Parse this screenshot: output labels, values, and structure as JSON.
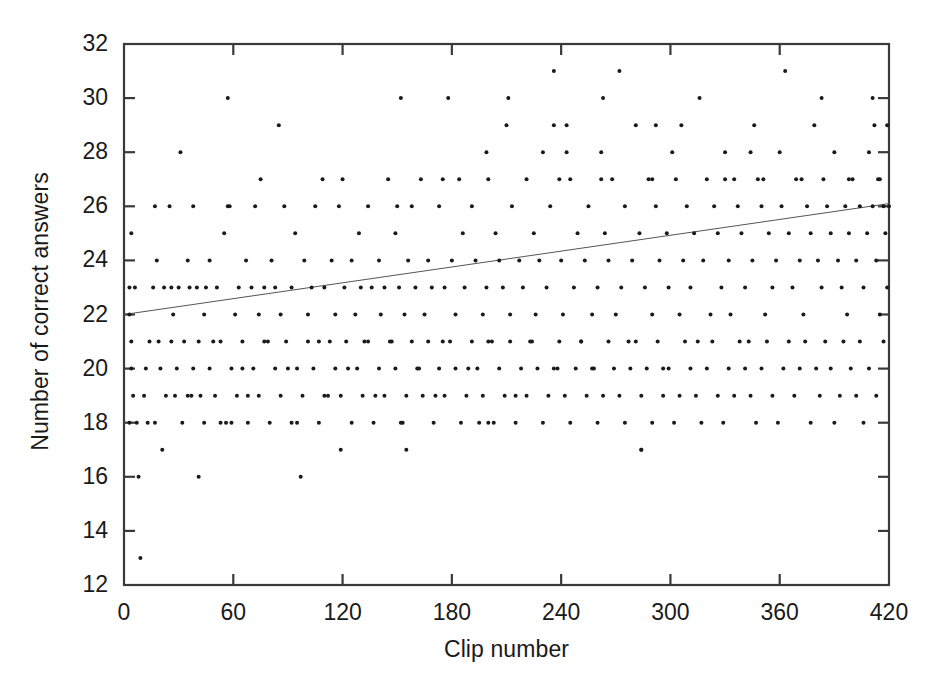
{
  "chart_data": {
    "type": "scatter",
    "title": "",
    "xlabel": "Clip number",
    "ylabel": "Number of correct answers",
    "xlim": [
      0,
      420
    ],
    "ylim": [
      12,
      32
    ],
    "xticks": [
      0,
      60,
      120,
      180,
      240,
      300,
      360,
      420
    ],
    "yticks": [
      12,
      14,
      16,
      18,
      20,
      22,
      24,
      26,
      28,
      30,
      32
    ],
    "grid": false,
    "legend": null,
    "marker": {
      "shape": "circle",
      "size_px": 4,
      "color": "#1a1a1a"
    },
    "trendline": {
      "label": "linear fit",
      "x": [
        0,
        420
      ],
      "y": [
        22.0,
        26.1
      ],
      "color": "#555555",
      "width_px": 1
    },
    "points": [
      [
        3,
        23
      ],
      [
        3,
        22
      ],
      [
        3,
        18
      ],
      [
        4,
        25
      ],
      [
        4,
        21
      ],
      [
        4,
        20
      ],
      [
        5,
        19
      ],
      [
        6,
        23
      ],
      [
        7,
        18
      ],
      [
        8,
        16
      ],
      [
        9,
        13
      ],
      [
        12,
        20
      ],
      [
        13,
        18
      ],
      [
        16,
        23
      ],
      [
        17,
        26
      ],
      [
        18,
        24
      ],
      [
        19,
        21
      ],
      [
        21,
        17
      ],
      [
        22,
        23
      ],
      [
        25,
        26
      ],
      [
        26,
        23
      ],
      [
        27,
        22
      ],
      [
        28,
        19
      ],
      [
        30,
        23
      ],
      [
        31,
        28
      ],
      [
        33,
        21
      ],
      [
        35,
        24
      ],
      [
        36,
        23
      ],
      [
        37,
        19
      ],
      [
        38,
        26
      ],
      [
        40,
        23
      ],
      [
        41,
        16
      ],
      [
        42,
        19
      ],
      [
        44,
        22
      ],
      [
        45,
        23
      ],
      [
        47,
        24
      ],
      [
        49,
        21
      ],
      [
        51,
        23
      ],
      [
        53,
        18
      ],
      [
        55,
        25
      ],
      [
        57,
        30
      ],
      [
        58,
        26
      ],
      [
        59,
        18
      ],
      [
        61,
        22
      ],
      [
        63,
        23
      ],
      [
        65,
        20
      ],
      [
        67,
        24
      ],
      [
        68,
        19
      ],
      [
        70,
        23
      ],
      [
        72,
        26
      ],
      [
        74,
        22
      ],
      [
        75,
        27
      ],
      [
        77,
        23
      ],
      [
        79,
        21
      ],
      [
        81,
        24
      ],
      [
        83,
        23
      ],
      [
        85,
        29
      ],
      [
        86,
        22
      ],
      [
        88,
        26
      ],
      [
        90,
        20
      ],
      [
        92,
        23
      ],
      [
        94,
        25
      ],
      [
        95,
        18
      ],
      [
        97,
        16
      ],
      [
        99,
        24
      ],
      [
        101,
        22
      ],
      [
        103,
        23
      ],
      [
        105,
        26
      ],
      [
        107,
        21
      ],
      [
        109,
        27
      ],
      [
        110,
        23
      ],
      [
        112,
        19
      ],
      [
        114,
        24
      ],
      [
        116,
        22
      ],
      [
        118,
        26
      ],
      [
        119,
        17
      ],
      [
        121,
        23
      ],
      [
        123,
        20
      ],
      [
        125,
        24
      ],
      [
        127,
        22
      ],
      [
        129,
        25
      ],
      [
        130,
        23
      ],
      [
        132,
        21
      ],
      [
        134,
        26
      ],
      [
        136,
        23
      ],
      [
        138,
        19
      ],
      [
        140,
        24
      ],
      [
        141,
        22
      ],
      [
        143,
        23
      ],
      [
        145,
        27
      ],
      [
        147,
        21
      ],
      [
        149,
        25
      ],
      [
        151,
        23
      ],
      [
        153,
        18
      ],
      [
        154,
        22
      ],
      [
        156,
        24
      ],
      [
        158,
        26
      ],
      [
        160,
        23
      ],
      [
        162,
        20
      ],
      [
        163,
        27
      ],
      [
        165,
        22
      ],
      [
        167,
        24
      ],
      [
        169,
        23
      ],
      [
        171,
        19
      ],
      [
        173,
        26
      ],
      [
        175,
        21
      ],
      [
        176,
        23
      ],
      [
        178,
        30
      ],
      [
        180,
        24
      ],
      [
        182,
        22
      ],
      [
        184,
        27
      ],
      [
        186,
        25
      ],
      [
        187,
        23
      ],
      [
        189,
        20
      ],
      [
        191,
        26
      ],
      [
        193,
        24
      ],
      [
        195,
        18
      ],
      [
        197,
        22
      ],
      [
        199,
        23
      ],
      [
        200,
        27
      ],
      [
        202,
        21
      ],
      [
        204,
        25
      ],
      [
        206,
        24
      ],
      [
        208,
        23
      ],
      [
        210,
        29
      ],
      [
        212,
        22
      ],
      [
        213,
        26
      ],
      [
        215,
        19
      ],
      [
        217,
        24
      ],
      [
        219,
        23
      ],
      [
        221,
        27
      ],
      [
        223,
        21
      ],
      [
        225,
        25
      ],
      [
        226,
        22
      ],
      [
        228,
        24
      ],
      [
        230,
        28
      ],
      [
        232,
        23
      ],
      [
        234,
        26
      ],
      [
        236,
        31
      ],
      [
        238,
        20
      ],
      [
        240,
        24
      ],
      [
        241,
        22
      ],
      [
        243,
        29
      ],
      [
        245,
        27
      ],
      [
        247,
        23
      ],
      [
        249,
        25
      ],
      [
        251,
        21
      ],
      [
        253,
        24
      ],
      [
        255,
        26
      ],
      [
        257,
        22
      ],
      [
        258,
        20
      ],
      [
        260,
        23
      ],
      [
        262,
        28
      ],
      [
        264,
        25
      ],
      [
        266,
        24
      ],
      [
        268,
        27
      ],
      [
        270,
        22
      ],
      [
        272,
        31
      ],
      [
        273,
        23
      ],
      [
        275,
        26
      ],
      [
        277,
        21
      ],
      [
        279,
        24
      ],
      [
        281,
        29
      ],
      [
        283,
        25
      ],
      [
        284,
        17
      ],
      [
        286,
        23
      ],
      [
        288,
        27
      ],
      [
        290,
        22
      ],
      [
        292,
        26
      ],
      [
        294,
        24
      ],
      [
        296,
        20
      ],
      [
        298,
        25
      ],
      [
        299,
        23
      ],
      [
        301,
        28
      ],
      [
        303,
        27
      ],
      [
        305,
        22
      ],
      [
        307,
        24
      ],
      [
        309,
        26
      ],
      [
        311,
        23
      ],
      [
        313,
        25
      ],
      [
        315,
        21
      ],
      [
        316,
        30
      ],
      [
        318,
        24
      ],
      [
        320,
        27
      ],
      [
        322,
        22
      ],
      [
        324,
        26
      ],
      [
        326,
        25
      ],
      [
        328,
        23
      ],
      [
        330,
        28
      ],
      [
        332,
        24
      ],
      [
        333,
        22
      ],
      [
        335,
        27
      ],
      [
        337,
        26
      ],
      [
        339,
        25
      ],
      [
        341,
        23
      ],
      [
        343,
        21
      ],
      [
        345,
        24
      ],
      [
        346,
        29
      ],
      [
        348,
        27
      ],
      [
        350,
        26
      ],
      [
        352,
        22
      ],
      [
        354,
        25
      ],
      [
        356,
        23
      ],
      [
        358,
        24
      ],
      [
        360,
        28
      ],
      [
        361,
        26
      ],
      [
        363,
        31
      ],
      [
        365,
        25
      ],
      [
        367,
        23
      ],
      [
        369,
        27
      ],
      [
        371,
        24
      ],
      [
        373,
        22
      ],
      [
        375,
        26
      ],
      [
        377,
        25
      ],
      [
        379,
        29
      ],
      [
        381,
        24
      ],
      [
        383,
        23
      ],
      [
        384,
        27
      ],
      [
        386,
        26
      ],
      [
        388,
        25
      ],
      [
        390,
        28
      ],
      [
        392,
        24
      ],
      [
        394,
        23
      ],
      [
        396,
        26
      ],
      [
        398,
        25
      ],
      [
        400,
        27
      ],
      [
        402,
        24
      ],
      [
        404,
        26
      ],
      [
        406,
        23
      ],
      [
        408,
        25
      ],
      [
        409,
        28
      ],
      [
        411,
        26
      ],
      [
        413,
        24
      ],
      [
        415,
        27
      ],
      [
        417,
        26
      ],
      [
        418,
        25
      ],
      [
        419,
        23
      ],
      [
        420,
        26
      ],
      [
        419,
        29
      ],
      [
        417,
        21
      ],
      [
        415,
        22
      ],
      [
        413,
        19
      ],
      [
        411,
        30
      ],
      [
        409,
        20
      ],
      [
        406,
        18
      ],
      [
        404,
        21
      ],
      [
        402,
        19
      ],
      [
        399,
        20
      ],
      [
        397,
        22
      ],
      [
        395,
        21
      ],
      [
        393,
        19
      ],
      [
        390,
        18
      ],
      [
        388,
        20
      ],
      [
        385,
        21
      ],
      [
        382,
        19
      ],
      [
        380,
        20
      ],
      [
        377,
        18
      ],
      [
        374,
        21
      ],
      [
        371,
        20
      ],
      [
        368,
        19
      ],
      [
        365,
        21
      ],
      [
        362,
        20
      ],
      [
        359,
        18
      ],
      [
        356,
        19
      ],
      [
        353,
        21
      ],
      [
        350,
        20
      ],
      [
        347,
        18
      ],
      [
        344,
        19
      ],
      [
        341,
        20
      ],
      [
        338,
        21
      ],
      [
        335,
        19
      ],
      [
        332,
        20
      ],
      [
        329,
        18
      ],
      [
        326,
        19
      ],
      [
        323,
        21
      ],
      [
        320,
        20
      ],
      [
        317,
        18
      ],
      [
        314,
        19
      ],
      [
        311,
        20
      ],
      [
        308,
        21
      ],
      [
        305,
        19
      ],
      [
        302,
        18
      ],
      [
        299,
        20
      ],
      [
        296,
        19
      ],
      [
        293,
        21
      ],
      [
        290,
        18
      ],
      [
        287,
        20
      ],
      [
        284,
        19
      ],
      [
        281,
        21
      ],
      [
        278,
        20
      ],
      [
        275,
        18
      ],
      [
        272,
        19
      ],
      [
        269,
        20
      ],
      [
        266,
        21
      ],
      [
        263,
        19
      ],
      [
        260,
        18
      ],
      [
        257,
        20
      ],
      [
        254,
        19
      ],
      [
        251,
        21
      ],
      [
        248,
        20
      ],
      [
        245,
        18
      ],
      [
        242,
        19
      ],
      [
        239,
        21
      ],
      [
        236,
        20
      ],
      [
        233,
        19
      ],
      [
        230,
        18
      ],
      [
        227,
        20
      ],
      [
        224,
        21
      ],
      [
        221,
        19
      ],
      [
        218,
        20
      ],
      [
        215,
        18
      ],
      [
        212,
        21
      ],
      [
        209,
        19
      ],
      [
        206,
        20
      ],
      [
        203,
        18
      ],
      [
        200,
        21
      ],
      [
        197,
        19
      ],
      [
        194,
        20
      ],
      [
        191,
        21
      ],
      [
        188,
        19
      ],
      [
        185,
        18
      ],
      [
        182,
        20
      ],
      [
        179,
        21
      ],
      [
        176,
        19
      ],
      [
        173,
        20
      ],
      [
        170,
        18
      ],
      [
        167,
        21
      ],
      [
        164,
        19
      ],
      [
        161,
        20
      ],
      [
        158,
        21
      ],
      [
        155,
        19
      ],
      [
        152,
        18
      ],
      [
        149,
        20
      ],
      [
        146,
        21
      ],
      [
        143,
        19
      ],
      [
        140,
        20
      ],
      [
        137,
        18
      ],
      [
        134,
        21
      ],
      [
        131,
        19
      ],
      [
        128,
        20
      ],
      [
        125,
        18
      ],
      [
        122,
        21
      ],
      [
        119,
        19
      ],
      [
        116,
        20
      ],
      [
        113,
        21
      ],
      [
        110,
        19
      ],
      [
        107,
        18
      ],
      [
        104,
        20
      ],
      [
        101,
        21
      ],
      [
        98,
        19
      ],
      [
        95,
        20
      ],
      [
        92,
        18
      ],
      [
        89,
        21
      ],
      [
        86,
        19
      ],
      [
        83,
        20
      ],
      [
        80,
        18
      ],
      [
        77,
        21
      ],
      [
        74,
        19
      ],
      [
        71,
        20
      ],
      [
        68,
        18
      ],
      [
        65,
        21
      ],
      [
        62,
        19
      ],
      [
        59,
        20
      ],
      [
        56,
        18
      ],
      [
        53,
        21
      ],
      [
        50,
        19
      ],
      [
        47,
        20
      ],
      [
        44,
        18
      ],
      [
        41,
        21
      ],
      [
        38,
        20
      ],
      [
        35,
        19
      ],
      [
        32,
        18
      ],
      [
        29,
        20
      ],
      [
        26,
        21
      ],
      [
        23,
        19
      ],
      [
        20,
        20
      ],
      [
        17,
        18
      ],
      [
        14,
        21
      ],
      [
        11,
        19
      ],
      [
        120,
        27
      ],
      [
        152,
        30
      ],
      [
        199,
        28
      ],
      [
        211,
        30
      ],
      [
        236,
        29
      ],
      [
        243,
        28
      ],
      [
        263,
        30
      ],
      [
        292,
        29
      ],
      [
        306,
        29
      ],
      [
        344,
        28
      ],
      [
        383,
        30
      ],
      [
        412,
        29
      ],
      [
        57,
        26
      ],
      [
        150,
        26
      ],
      [
        175,
        27
      ],
      [
        239,
        27
      ],
      [
        262,
        27
      ],
      [
        290,
        27
      ],
      [
        330,
        27
      ],
      [
        351,
        27
      ],
      [
        372,
        27
      ],
      [
        398,
        27
      ],
      [
        414,
        27
      ],
      [
        155,
        17
      ],
      [
        200,
        18
      ],
      [
        284,
        17
      ]
    ]
  },
  "axis": {
    "x_tick_labels": [
      "0",
      "60",
      "120",
      "180",
      "240",
      "300",
      "360",
      "420"
    ],
    "y_tick_labels": [
      "12",
      "14",
      "16",
      "18",
      "20",
      "22",
      "24",
      "26",
      "28",
      "30",
      "32"
    ],
    "x_axis_title": "Clip number",
    "y_axis_title": "Number of correct answers"
  },
  "style": {
    "frame_color": "#3a3a3a",
    "marker_color": "#1a1a1a",
    "trendline_color": "#555555",
    "background": "#ffffff"
  }
}
